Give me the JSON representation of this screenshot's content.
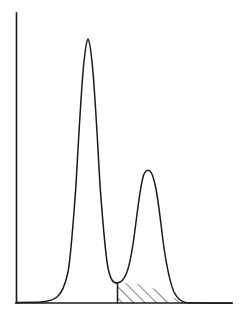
{
  "figure": {
    "title": "",
    "background_color": "#ffffff",
    "line_color": "#1a1a1a",
    "width_px": 239,
    "height_px": 318
  },
  "axes": {
    "y_axis": {
      "name": "y-axis",
      "x": 16,
      "y_top": 13,
      "y_bottom": 303,
      "has_ticks": false,
      "label": ""
    },
    "x_axis": {
      "name": "x-axis",
      "y": 303,
      "x_left": 16,
      "x_right": 232,
      "has_ticks": false,
      "label": ""
    },
    "grid": false,
    "tick_labels_x": [],
    "tick_labels_y": []
  },
  "chart_data": {
    "type": "line",
    "title": "",
    "subtitle": "",
    "xlabel": "",
    "ylabel": "",
    "xlim": [
      0,
      239
    ],
    "ylim": [
      0,
      318
    ],
    "grid": false,
    "legend": [],
    "legend_position": "none",
    "series": [
      {
        "name": "peak-1",
        "role": "tall-left-peak",
        "apex_x": 88,
        "apex_y": 39,
        "apex_height_px": 264,
        "relative_height": 1.0,
        "baseline_start_x": 33,
        "baseline_end_x": 121,
        "half_width_px": 12
      },
      {
        "name": "peak-2",
        "role": "short-right-peak",
        "apex_x": 150,
        "apex_y": 171,
        "apex_height_px": 132,
        "relative_height": 0.5,
        "baseline_start_x": 117,
        "baseline_end_x": 205,
        "half_width_px": 13
      }
    ],
    "valley": {
      "name": "valley-between-peaks",
      "x": 117,
      "y": 283,
      "height_px": 20
    },
    "hatched_region": {
      "name": "hatched-area",
      "pattern": "diagonal-lines",
      "angle_deg": 45,
      "line_count": 9,
      "left_boundary_x": 117,
      "right_boundary_x": 193,
      "top_y": 283,
      "bottom_y": 303,
      "fill": "none",
      "stroke": "#1a1a1a"
    },
    "x": [],
    "values": []
  },
  "annotations": []
}
